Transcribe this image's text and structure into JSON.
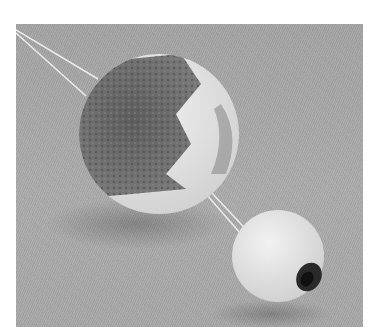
{
  "image": {
    "description": "Grayscale photo of two yarn pom-poms with white strings on a gray textured background",
    "background_color": "#a8a8a8",
    "subjects": [
      {
        "name": "large-pompom",
        "colors": [
          "#6e6e6e",
          "#d8d8d8"
        ]
      },
      {
        "name": "small-pompom",
        "colors": [
          "#e6e6e6",
          "#2a2a2a"
        ]
      }
    ]
  }
}
